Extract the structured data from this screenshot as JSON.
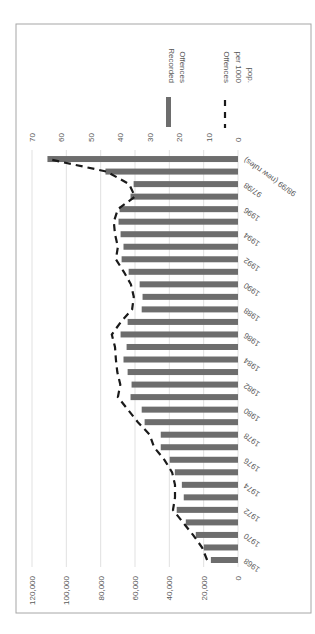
{
  "chart_data": {
    "type": "bar",
    "orientation_note": "chart rotated 90 degrees clockwise on the page",
    "title": "",
    "xlabel": "",
    "ylabel": "",
    "categories": [
      "1968",
      "1969",
      "1970",
      "1971",
      "1972",
      "1973",
      "1974",
      "1975",
      "1976",
      "1977",
      "1978",
      "1979",
      "1980",
      "1981",
      "1982",
      "1983",
      "1984",
      "1985",
      "1986",
      "1987",
      "1988",
      "1989",
      "1990",
      "1991",
      "1992",
      "1993",
      "1994",
      "1995",
      "1996",
      "1997",
      "97/98",
      "98/99",
      "98/99 (new rules)"
    ],
    "category_labels_shown": [
      "1968",
      "1970",
      "1972",
      "1974",
      "1976",
      "1978",
      "1980",
      "1982",
      "1984",
      "1986",
      "1988",
      "1990",
      "1992",
      "1994",
      "1996",
      "97/98",
      "98/99 (new rules)"
    ],
    "series": [
      {
        "name": "Recorded Offences",
        "type": "bar",
        "axis": "primary",
        "color": "#6d6d6d",
        "values": [
          15800,
          19900,
          24600,
          30400,
          35700,
          31600,
          32700,
          36800,
          39800,
          45000,
          45000,
          54400,
          56100,
          62600,
          62000,
          64300,
          66700,
          64900,
          68400,
          64300,
          56100,
          55600,
          57300,
          63700,
          67800,
          66700,
          68400,
          69600,
          69000,
          62600,
          60800,
          77200,
          111000
        ]
      },
      {
        "name": "Offences per 1000 pop.",
        "type": "line",
        "style": "dashed",
        "axis": "secondary",
        "color": "#1a1a1a",
        "values": [
          10.5,
          12.2,
          15.3,
          18.7,
          22.1,
          21.4,
          21.4,
          22.4,
          25,
          28.5,
          30,
          34,
          37.4,
          40.8,
          40,
          41,
          41.5,
          41.8,
          42.9,
          39.8,
          36,
          35.4,
          36.4,
          38.8,
          41.5,
          40.8,
          41.8,
          42.2,
          40.8,
          35,
          37,
          44.6,
          64.6
        ]
      }
    ],
    "primary_axis": {
      "ticks": [
        "0",
        "20,000",
        "40,000",
        "60,000",
        "80,000",
        "100,000",
        "120,000"
      ],
      "ylim": [
        0,
        120000
      ]
    },
    "secondary_axis": {
      "ticks": [
        "0",
        "10",
        "20",
        "30",
        "40",
        "50",
        "60",
        "70"
      ],
      "ylim": [
        0,
        70
      ]
    },
    "grid": true,
    "legend": {
      "position": "right",
      "entries": [
        "Recorded Offences",
        "Offences per 1000 pop."
      ]
    }
  },
  "legend": {
    "bar_label_line1": "Recorded",
    "bar_label_line2": "Offences",
    "line_label_line1": "Offences",
    "line_label_line2": "per 1000",
    "line_label_line3": "pop."
  }
}
